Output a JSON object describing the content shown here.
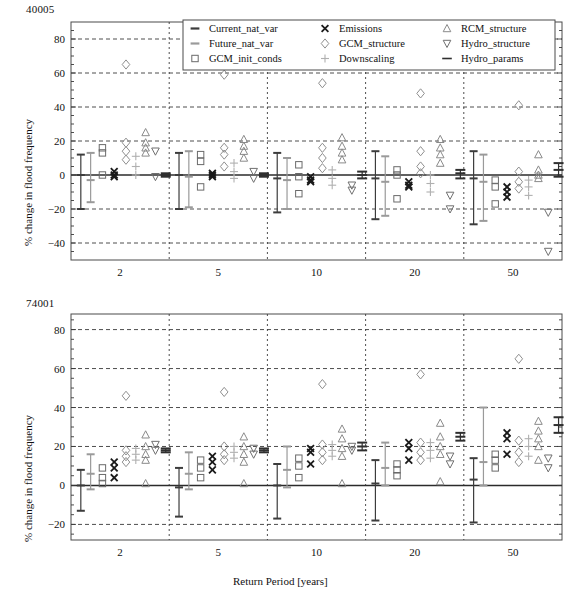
{
  "figure": {
    "background": "#ffffff",
    "xlabel": "Return Period [years]",
    "categories": [
      "2",
      "5",
      "10",
      "20",
      "50"
    ],
    "legend": {
      "position": "top-center-upper-panel",
      "entries": [
        {
          "label": "Current_nat_var",
          "marker": "hbar",
          "color": "#3c3c3c"
        },
        {
          "label": "Future_nat_var",
          "marker": "hbar",
          "color": "#9a9a9a"
        },
        {
          "label": "GCM_init_conds",
          "marker": "square",
          "color": "#6a6a6a"
        },
        {
          "label": "Emissions",
          "marker": "cross",
          "color": "#1a1a1a"
        },
        {
          "label": "GCM_structure",
          "marker": "diamond",
          "color": "#8f8f8f"
        },
        {
          "label": "Downscaling",
          "marker": "plus",
          "color": "#b0b0b0"
        },
        {
          "label": "RCM_structure",
          "marker": "triangle-up",
          "color": "#8a8a8a"
        },
        {
          "label": "Hydro_structure",
          "marker": "triangle-down",
          "color": "#6f6f6f"
        },
        {
          "label": "Hydro_params",
          "marker": "dash",
          "color": "#2f2f2f"
        }
      ]
    }
  },
  "chart_data": [
    {
      "type": "scatter",
      "title": "40005",
      "ylabel": "% change in flood frequency",
      "xlabel": "",
      "categories": [
        "2",
        "5",
        "10",
        "20",
        "50"
      ],
      "yticks": [
        80,
        60,
        40,
        20,
        0,
        -20,
        -40
      ],
      "ylim": [
        -50,
        90
      ],
      "gridlines": [
        80,
        60,
        40,
        20,
        0,
        -20,
        -40
      ],
      "series": [
        {
          "name": "Current_nat_var",
          "marker": "range",
          "color": "#3c3c3c",
          "points": [
            {
              "cat": "2",
              "center": 0,
              "low": -20,
              "high": 12
            },
            {
              "cat": "5",
              "center": 0,
              "low": -20,
              "high": 13
            },
            {
              "cat": "10",
              "center": -2,
              "low": -22,
              "high": 13
            },
            {
              "cat": "20",
              "center": -2,
              "low": -26,
              "high": 14
            },
            {
              "cat": "50",
              "center": -2,
              "low": -29,
              "high": 14
            }
          ]
        },
        {
          "name": "Future_nat_var",
          "marker": "range",
          "color": "#9a9a9a",
          "points": [
            {
              "cat": "2",
              "center": -3,
              "low": -16,
              "high": 13
            },
            {
              "cat": "5",
              "center": -1,
              "low": -19,
              "high": 14
            },
            {
              "cat": "10",
              "center": -3,
              "low": -20,
              "high": 10
            },
            {
              "cat": "20",
              "center": -4,
              "low": -24,
              "high": 11
            },
            {
              "cat": "50",
              "center": -4,
              "low": -27,
              "high": 12
            }
          ]
        },
        {
          "name": "GCM_init_conds",
          "marker": "square",
          "color": "#6a6a6a",
          "values": [
            {
              "cat": "2",
              "vals": [
                16,
                13,
                0
              ]
            },
            {
              "cat": "5",
              "vals": [
                12,
                8,
                -7
              ]
            },
            {
              "cat": "10",
              "vals": [
                6,
                -1,
                -11
              ]
            },
            {
              "cat": "20",
              "vals": [
                3,
                0,
                -14
              ]
            },
            {
              "cat": "50",
              "vals": [
                -3,
                -7,
                -17
              ]
            }
          ]
        },
        {
          "name": "Emissions",
          "marker": "cross",
          "color": "#1a1a1a",
          "values": [
            {
              "cat": "2",
              "vals": [
                2,
                0,
                -1
              ]
            },
            {
              "cat": "5",
              "vals": [
                1,
                0,
                -1
              ]
            },
            {
              "cat": "10",
              "vals": [
                -1,
                -3,
                -4
              ]
            },
            {
              "cat": "20",
              "vals": [
                -4,
                -6,
                -7
              ]
            },
            {
              "cat": "50",
              "vals": [
                -7,
                -10,
                -13
              ]
            }
          ]
        },
        {
          "name": "GCM_structure",
          "marker": "diamond",
          "color": "#8f8f8f",
          "values": [
            {
              "cat": "2",
              "vals": [
                65,
                19,
                14,
                9
              ]
            },
            {
              "cat": "5",
              "vals": [
                59,
                16,
                12,
                5
              ]
            },
            {
              "cat": "10",
              "vals": [
                54,
                16,
                10,
                4
              ]
            },
            {
              "cat": "20",
              "vals": [
                48,
                14,
                5,
                1
              ]
            },
            {
              "cat": "50",
              "vals": [
                41,
                2,
                -4,
                -8
              ]
            }
          ]
        },
        {
          "name": "Downscaling",
          "marker": "plus",
          "color": "#b0b0b0",
          "values": [
            {
              "cat": "2",
              "vals": [
                11,
                5,
                0
              ]
            },
            {
              "cat": "5",
              "vals": [
                7,
                2,
                -2
              ]
            },
            {
              "cat": "10",
              "vals": [
                3,
                -2,
                -6
              ]
            },
            {
              "cat": "20",
              "vals": [
                0,
                -5,
                -10
              ]
            },
            {
              "cat": "50",
              "vals": [
                -3,
                -7,
                -12
              ]
            }
          ]
        },
        {
          "name": "RCM_structure",
          "marker": "triangle-up",
          "color": "#8a8a8a",
          "values": [
            {
              "cat": "2",
              "vals": [
                25,
                19,
                16,
                13
              ]
            },
            {
              "cat": "5",
              "vals": [
                21,
                17,
                14,
                10
              ]
            },
            {
              "cat": "10",
              "vals": [
                22,
                17,
                13,
                9
              ]
            },
            {
              "cat": "20",
              "vals": [
                21,
                16,
                12,
                7
              ]
            },
            {
              "cat": "50",
              "vals": [
                12,
                3,
                0,
                -2
              ]
            }
          ]
        },
        {
          "name": "Hydro_structure",
          "marker": "triangle-down",
          "color": "#6f6f6f",
          "values": [
            {
              "cat": "2",
              "vals": [
                14,
                -1
              ]
            },
            {
              "cat": "5",
              "vals": [
                2,
                -2
              ]
            },
            {
              "cat": "10",
              "vals": [
                -6,
                -9
              ]
            },
            {
              "cat": "20",
              "vals": [
                -12,
                -20
              ]
            },
            {
              "cat": "50",
              "vals": [
                -22,
                -45
              ]
            }
          ]
        },
        {
          "name": "Hydro_params",
          "marker": "range-dash",
          "color": "#2f2f2f",
          "points": [
            {
              "cat": "2",
              "center": 0,
              "low": -1,
              "high": 1
            },
            {
              "cat": "5",
              "center": 0,
              "low": -1,
              "high": 1
            },
            {
              "cat": "10",
              "center": 0,
              "low": -2,
              "high": 2
            },
            {
              "cat": "20",
              "center": 1,
              "low": -2,
              "high": 3
            },
            {
              "cat": "50",
              "center": 3,
              "low": -1,
              "high": 7
            }
          ]
        }
      ]
    },
    {
      "type": "scatter",
      "title": "74001",
      "ylabel": "% change in flood frequency",
      "xlabel": "Return Period [years]",
      "categories": [
        "2",
        "5",
        "10",
        "20",
        "50"
      ],
      "yticks": [
        80,
        60,
        40,
        20,
        0,
        -20
      ],
      "ylim": [
        -28,
        88
      ],
      "gridlines": [
        80,
        60,
        40,
        20,
        0,
        -20
      ],
      "series": [
        {
          "name": "Current_nat_var",
          "marker": "range",
          "color": "#3c3c3c",
          "points": [
            {
              "cat": "2",
              "center": 0,
              "low": -13,
              "high": 8
            },
            {
              "cat": "5",
              "center": -1,
              "low": -16,
              "high": 9
            },
            {
              "cat": "10",
              "center": 0,
              "low": -17,
              "high": 11
            },
            {
              "cat": "20",
              "center": 1,
              "low": -18,
              "high": 13
            },
            {
              "cat": "50",
              "center": 3,
              "low": -19,
              "high": 14
            }
          ]
        },
        {
          "name": "Future_nat_var",
          "marker": "range",
          "color": "#9a9a9a",
          "points": [
            {
              "cat": "2",
              "center": 6,
              "low": -2,
              "high": 16
            },
            {
              "cat": "5",
              "center": 6,
              "low": -2,
              "high": 17
            },
            {
              "cat": "10",
              "center": 8,
              "low": -1,
              "high": 20
            },
            {
              "cat": "20",
              "center": 9,
              "low": 0,
              "high": 22
            },
            {
              "cat": "50",
              "center": 12,
              "low": 0,
              "high": 40
            }
          ]
        },
        {
          "name": "GCM_init_conds",
          "marker": "square",
          "color": "#6a6a6a",
          "values": [
            {
              "cat": "2",
              "vals": [
                9,
                4,
                1
              ]
            },
            {
              "cat": "5",
              "vals": [
                13,
                9,
                4
              ]
            },
            {
              "cat": "10",
              "vals": [
                14,
                10,
                4
              ]
            },
            {
              "cat": "20",
              "vals": [
                11,
                8,
                5
              ]
            },
            {
              "cat": "50",
              "vals": [
                16,
                13,
                9
              ]
            }
          ]
        },
        {
          "name": "Emissions",
          "marker": "cross",
          "color": "#1a1a1a",
          "values": [
            {
              "cat": "2",
              "vals": [
                12,
                9,
                4
              ]
            },
            {
              "cat": "5",
              "vals": [
                15,
                12,
                8
              ]
            },
            {
              "cat": "10",
              "vals": [
                19,
                17,
                11
              ]
            },
            {
              "cat": "20",
              "vals": [
                22,
                19,
                13
              ]
            },
            {
              "cat": "50",
              "vals": [
                27,
                24,
                16
              ]
            }
          ]
        },
        {
          "name": "GCM_structure",
          "marker": "diamond",
          "color": "#8f8f8f",
          "values": [
            {
              "cat": "2",
              "vals": [
                46,
                18,
                15,
                12
              ]
            },
            {
              "cat": "5",
              "vals": [
                48,
                20,
                16,
                13
              ]
            },
            {
              "cat": "10",
              "vals": [
                52,
                21,
                17,
                13
              ]
            },
            {
              "cat": "20",
              "vals": [
                57,
                22,
                17,
                13
              ]
            },
            {
              "cat": "50",
              "vals": [
                65,
                23,
                17,
                12
              ]
            }
          ]
        },
        {
          "name": "Downscaling",
          "marker": "plus",
          "color": "#b0b0b0",
          "values": [
            {
              "cat": "2",
              "vals": [
                19,
                16,
                13
              ]
            },
            {
              "cat": "5",
              "vals": [
                20,
                17,
                14
              ]
            },
            {
              "cat": "10",
              "vals": [
                21,
                18,
                15
              ]
            },
            {
              "cat": "20",
              "vals": [
                22,
                18,
                14
              ]
            },
            {
              "cat": "50",
              "vals": [
                24,
                20,
                15
              ]
            }
          ]
        },
        {
          "name": "RCM_structure",
          "marker": "triangle-up",
          "color": "#8a8a8a",
          "values": [
            {
              "cat": "2",
              "vals": [
                26,
                20,
                16,
                13,
                1
              ]
            },
            {
              "cat": "5",
              "vals": [
                25,
                20,
                16,
                12,
                1
              ]
            },
            {
              "cat": "10",
              "vals": [
                29,
                24,
                19,
                15,
                1
              ]
            },
            {
              "cat": "20",
              "vals": [
                32,
                25,
                20,
                16,
                2
              ]
            },
            {
              "cat": "50",
              "vals": [
                33,
                28,
                24,
                20,
                13
              ]
            }
          ]
        },
        {
          "name": "Hydro_structure",
          "marker": "triangle-down",
          "color": "#6f6f6f",
          "values": [
            {
              "cat": "2",
              "vals": [
                21,
                18
              ]
            },
            {
              "cat": "5",
              "vals": [
                19,
                16
              ]
            },
            {
              "cat": "10",
              "vals": [
                20,
                18
              ]
            },
            {
              "cat": "20",
              "vals": [
                15,
                11
              ]
            },
            {
              "cat": "50",
              "vals": [
                14,
                9
              ]
            }
          ]
        },
        {
          "name": "Hydro_params",
          "marker": "range-dash",
          "color": "#2f2f2f",
          "points": [
            {
              "cat": "2",
              "center": 18,
              "low": 17,
              "high": 19
            },
            {
              "cat": "5",
              "center": 18,
              "low": 17,
              "high": 19
            },
            {
              "cat": "10",
              "center": 20,
              "low": 18,
              "high": 22
            },
            {
              "cat": "20",
              "center": 25,
              "low": 23,
              "high": 27
            },
            {
              "cat": "50",
              "center": 31,
              "low": 27,
              "high": 35
            }
          ]
        }
      ]
    }
  ]
}
